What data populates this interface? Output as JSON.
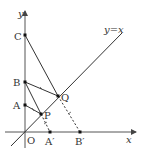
{
  "diagram": {
    "type": "coordinate-geometry",
    "axes": {
      "x_label": "x",
      "y_label": "y",
      "origin_label": "O"
    },
    "line_label": "y=x",
    "points": {
      "C": "C",
      "B": "B",
      "A": "A",
      "P": "P",
      "Q": "Q",
      "A_prime": "A′",
      "B_prime": "B′"
    },
    "segments": [
      {
        "from": "C",
        "to": "Q",
        "style": "solid",
        "extends": "beyond Q"
      },
      {
        "from": "B",
        "to": "P",
        "style": "solid"
      },
      {
        "from": "B",
        "to": "Q",
        "style": "solid",
        "tick_marks": 1
      },
      {
        "from": "A",
        "to": "P",
        "style": "solid",
        "tick_marks": 1
      },
      {
        "from": "P",
        "to": "A′",
        "style": "dashed",
        "tick_marks": 1
      },
      {
        "from": "Q",
        "to": "B′",
        "style": "dashed",
        "tick_marks": 1
      }
    ],
    "colors": {
      "line": "#333333",
      "axis": "#555555",
      "text": "#333333"
    }
  }
}
